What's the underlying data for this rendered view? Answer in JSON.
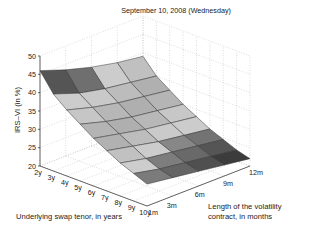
{
  "chart_data": {
    "type": "surface3d",
    "title": "September 10, 2008 (Wednesday)",
    "xlabel": "Underlying swap tenor, in years",
    "ylabel_lines": [
      "Length of the volatility",
      "contract, in months"
    ],
    "zlabel": "IRS–VI (in %)",
    "x": [
      "2y",
      "3y",
      "4y",
      "5y",
      "6y",
      "7y",
      "8y",
      "9y",
      "10y"
    ],
    "y": [
      "1m",
      "3m",
      "6m",
      "9m",
      "12m"
    ],
    "z_ticks": [
      20,
      25,
      30,
      35,
      40,
      45,
      50
    ],
    "zlim": [
      20,
      50
    ],
    "grid": true,
    "colormap": "gray",
    "z_values": [
      [
        46.0,
        43.5,
        41.5,
        40.0,
        39.0
      ],
      [
        41.0,
        38.5,
        37.0,
        36.0,
        35.0
      ],
      [
        38.0,
        36.0,
        34.5,
        33.5,
        32.5
      ],
      [
        35.5,
        33.5,
        32.0,
        31.0,
        30.0
      ],
      [
        33.0,
        31.5,
        30.0,
        29.0,
        28.0
      ],
      [
        31.0,
        29.5,
        28.0,
        27.0,
        26.0
      ],
      [
        29.0,
        27.5,
        26.5,
        25.5,
        24.5
      ],
      [
        27.5,
        26.0,
        25.0,
        24.0,
        23.0
      ],
      [
        26.0,
        25.0,
        24.0,
        23.0,
        22.0
      ]
    ]
  },
  "labels": {
    "title": "September 10, 2008 (Wednesday)",
    "xlabel": "Underlying swap tenor, in years",
    "ylabel_line1": "Length of the volatility",
    "ylabel_line2": "contract, in months",
    "zlabel": "IRS–VI (in %)"
  },
  "colors": {
    "background": "#ffffff",
    "axis": "#222222",
    "grid": "#bbbbbb",
    "edge": "#333333"
  }
}
